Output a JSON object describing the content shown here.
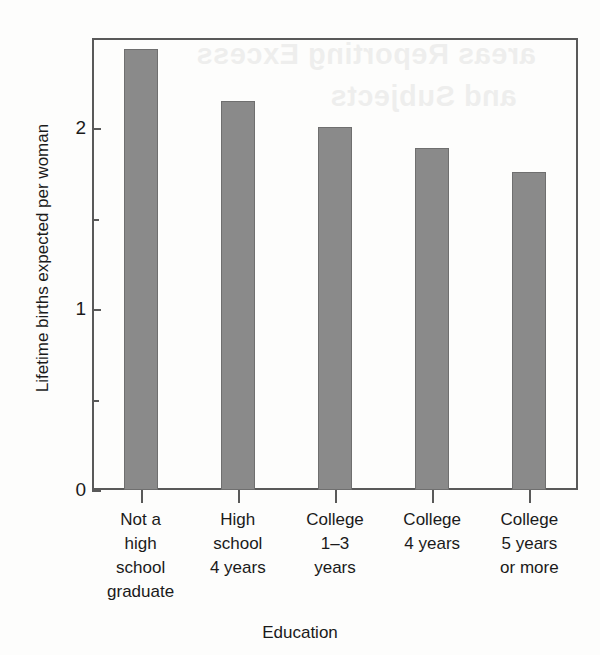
{
  "figure": {
    "y_axis_title": "Lifetime births expected per woman",
    "x_axis_title": "Education",
    "bar_color": "#8a8a8a",
    "bar_edge_color": "#6f6f6f",
    "axis_color": "#595959",
    "background_color": "#ffffff"
  },
  "scan_artifacts": {
    "bleed_line_1": "areas Reporting Excess",
    "bleed_line_2": "and Subjects"
  },
  "chart_data": {
    "type": "bar",
    "title": "",
    "xlabel": "Education",
    "ylabel": "Lifetime births expected per woman",
    "categories": [
      "Not a high school graduate",
      "High school 4 years",
      "College 1–3 years",
      "College 4 years",
      "College 5 years or more"
    ],
    "category_lines": [
      [
        "Not a",
        "high",
        "school",
        "graduate"
      ],
      [
        "High",
        "school",
        "4 years"
      ],
      [
        "College",
        "1–3",
        "years"
      ],
      [
        "College",
        "4 years"
      ],
      [
        "College",
        "5 years",
        "or more"
      ]
    ],
    "values": [
      2.44,
      2.15,
      2.01,
      1.89,
      1.76
    ],
    "ylim": [
      0,
      2.5
    ],
    "yticks_major": [
      0,
      1,
      2
    ],
    "yticks_major_labels": [
      "0",
      "1",
      "2"
    ],
    "yticks_minor": [
      0.5,
      1.5,
      2.5
    ],
    "grid": false,
    "legend": false
  }
}
